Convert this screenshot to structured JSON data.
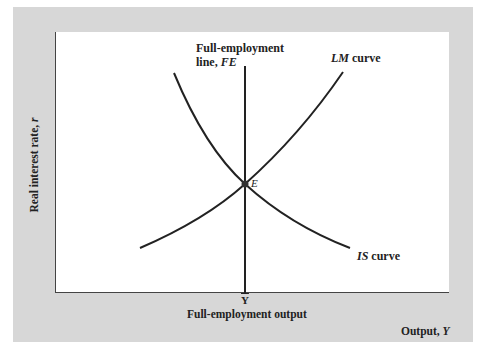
{
  "diagram": {
    "type": "IS-LM-FE",
    "colors": {
      "panel": "#d7d7d7",
      "plot_bg": "#ffffff",
      "line": "#222222"
    },
    "axes": {
      "y_label": "Real interest rate, ",
      "y_label_var": "r",
      "x_label": "Output, ",
      "x_label_var": "Y"
    },
    "fe_line": {
      "label_line1": "Full-employment",
      "label_line2_prefix": "line, ",
      "label_line2_var": "FE"
    },
    "lm_curve": {
      "label_var": "LM",
      "label_suffix": " curve"
    },
    "is_curve": {
      "label_var": "IS",
      "label_suffix": " curve"
    },
    "equilibrium": {
      "label": "E"
    },
    "x_tick": {
      "symbol": "Y",
      "label": "Full-employment output"
    }
  }
}
